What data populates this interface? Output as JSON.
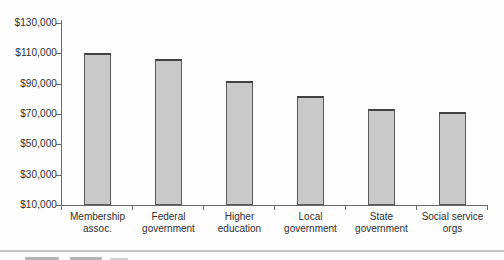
{
  "figure": {
    "background": "#fdfdfd",
    "bottom_rule_color": "#c6c6c6"
  },
  "chart_data": {
    "type": "bar",
    "title": "",
    "xlabel": "",
    "ylabel": "",
    "categories": [
      "Membership assoc.",
      "Federal government",
      "Higher education",
      "Local government",
      "State government",
      "Social service orgs"
    ],
    "category_label_lines": [
      [
        "Membership",
        "assoc."
      ],
      [
        "Federal",
        "government"
      ],
      [
        "Higher",
        "education"
      ],
      [
        "Local",
        "government"
      ],
      [
        "State",
        "government"
      ],
      [
        "Social service",
        "orgs"
      ]
    ],
    "values": [
      110000,
      106000,
      92000,
      82000,
      73000,
      71000
    ],
    "y_axis": {
      "min": 10000,
      "max": 130000,
      "tick_interval": 20000,
      "tick_labels": [
        "$10,000",
        "$30,000",
        "$50,000",
        "$70,000",
        "$90,000",
        "$110,000",
        "$130,000"
      ]
    },
    "grid": false,
    "legend": false,
    "bar_fill": "#c9c9c9",
    "bar_border": "#5a5a5a",
    "axis_color": "#6a6a6a",
    "label_color": "#2f2f2f"
  }
}
